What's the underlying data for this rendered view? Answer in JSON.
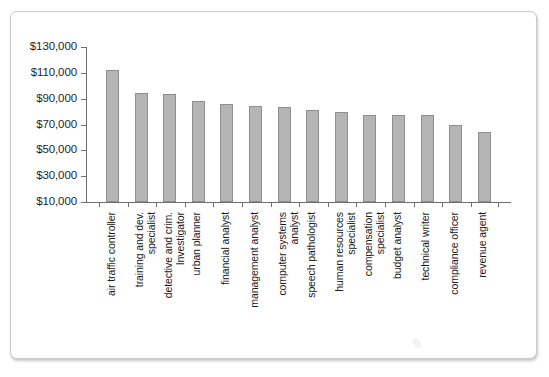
{
  "chart_data": {
    "type": "bar",
    "title": "",
    "subtitle": "",
    "xlabel": "",
    "ylabel": "",
    "ylim": [
      10000,
      130000
    ],
    "ytick_step": 20000,
    "grid": false,
    "legend": null,
    "bar_color": "#b5b5b5",
    "bar_edge_color": "#8e8e8e",
    "axis_color": "#6e6e6e",
    "ytick_labels": [
      "$130,000",
      "$110,000",
      "$90,000",
      "$70,000",
      "$50,000",
      "$30,000",
      "$10,000"
    ],
    "ytick_values": [
      130000,
      110000,
      90000,
      70000,
      50000,
      30000,
      10000
    ],
    "categories": [
      "air traffic controller",
      "training and dev.\nspecialist",
      "detective and crim.\nInvestigator",
      "urban planner",
      "financial analyst",
      "management analyst",
      "computer systems\nanalyst",
      "speech pathologist",
      "human resources\nspecialist",
      "compensation\nspecialist",
      "budget analyst",
      "technical writer",
      "compliance officer",
      "revenue agent"
    ],
    "values": [
      112000,
      94500,
      93500,
      88500,
      86000,
      84000,
      83500,
      81000,
      80000,
      77500,
      77500,
      77000,
      69500,
      64500
    ]
  },
  "watermark": {
    "text": "✎",
    "visible": true
  }
}
